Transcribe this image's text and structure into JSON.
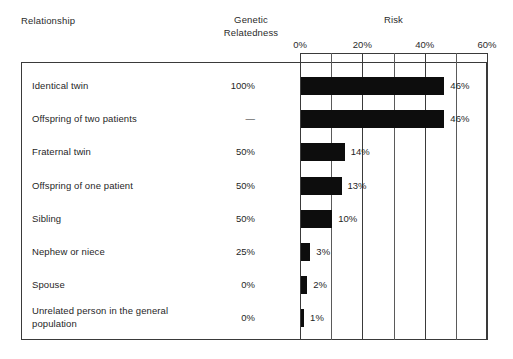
{
  "header": {
    "col_relationship": "Relationship",
    "col_genetic": "Genetic Relatedness",
    "col_genetic_line1": "Genetic",
    "col_genetic_line2": "Relatedness",
    "col_risk": "Risk"
  },
  "axis": {
    "ticks": [
      "0%",
      "20%",
      "40%",
      "60%"
    ],
    "tick_values": [
      0,
      20,
      40,
      60
    ],
    "minor_step": 10,
    "min": 0,
    "max": 60
  },
  "rows": [
    {
      "relationship": "Identical twin",
      "genetic": "100%",
      "risk": "46%",
      "risk_value": 46
    },
    {
      "relationship": "Offspring of two patients",
      "genetic": "—",
      "risk": "46%",
      "risk_value": 46
    },
    {
      "relationship": "Fraternal twin",
      "genetic": "50%",
      "risk": "14%",
      "risk_value": 14
    },
    {
      "relationship": "Offspring of one patient",
      "genetic": "50%",
      "risk": "13%",
      "risk_value": 13
    },
    {
      "relationship": "Sibling",
      "genetic": "50%",
      "risk": "10%",
      "risk_value": 10
    },
    {
      "relationship": "Nephew or niece",
      "genetic": "25%",
      "risk": "3%",
      "risk_value": 3
    },
    {
      "relationship": "Spouse",
      "genetic": "0%",
      "risk": "2%",
      "risk_value": 2
    },
    {
      "relationship": "Unrelated person in the general population",
      "genetic": "0%",
      "risk": "1%",
      "risk_value": 1
    }
  ],
  "colors": {
    "bar": "#0d0d0d",
    "grid": "#3a3a3a",
    "frame": "#3a3a3a",
    "text": "#1f1f1f",
    "background": "#ffffff"
  },
  "chart_data": {
    "type": "bar",
    "orientation": "horizontal",
    "title": "Risk",
    "xlabel": "Risk",
    "ylabel": "Relationship",
    "categories": [
      "Identical twin",
      "Offspring of two patients",
      "Fraternal twin",
      "Offspring of one patient",
      "Sibling",
      "Nephew or niece",
      "Spouse",
      "Unrelated person in the general population"
    ],
    "values": [
      46,
      46,
      14,
      13,
      10,
      3,
      2,
      1
    ],
    "value_labels": [
      "46%",
      "46%",
      "14%",
      "13%",
      "10%",
      "3%",
      "2%",
      "1%"
    ],
    "secondary_column": {
      "name": "Genetic Relatedness",
      "values": [
        "100%",
        "—",
        "50%",
        "50%",
        "50%",
        "25%",
        "0%",
        "0%"
      ]
    },
    "xlim": [
      0,
      60
    ],
    "xticks": [
      0,
      20,
      40,
      60
    ],
    "xticklabels": [
      "0%",
      "20%",
      "40%",
      "60%"
    ],
    "minor_xticks": [
      10,
      30,
      50
    ],
    "grid": true,
    "legend": null
  }
}
